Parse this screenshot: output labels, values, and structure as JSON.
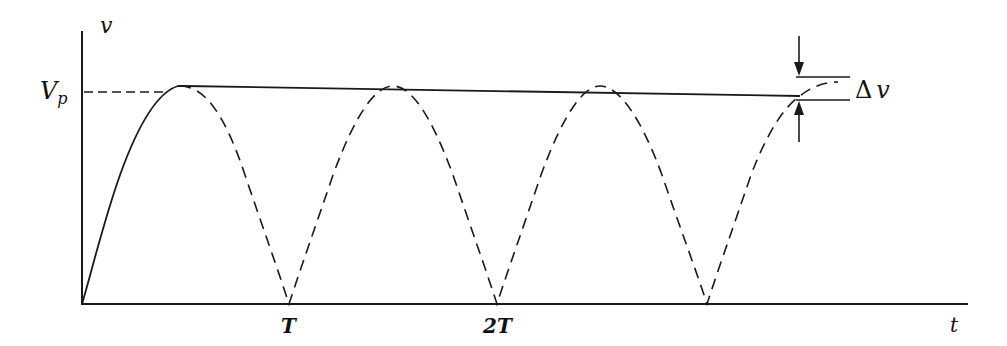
{
  "figure": {
    "type": "waveform-diagram",
    "colors": {
      "ink": "#1a1a1a",
      "background": "#ffffff"
    }
  },
  "axes": {
    "y_label": "v",
    "x_label": "t",
    "level_label_main": "V",
    "level_label_sub": "p",
    "x_ticks": [
      "T",
      "2T"
    ]
  },
  "annotations": {
    "ripple_delta": "Δ",
    "ripple_var": "v"
  },
  "curves": {
    "rectified_input": {
      "style": "dashed",
      "troughs_at": [
        "T",
        "2T",
        "3T"
      ]
    },
    "filtered_output": {
      "style": "solid",
      "peak": "Vp",
      "ripple": "Δv"
    }
  }
}
